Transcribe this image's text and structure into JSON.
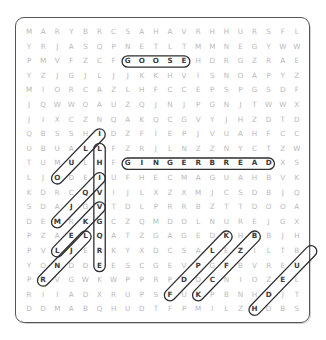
{
  "puzzle": {
    "type": "word-search",
    "rows": 20,
    "cols": 20,
    "frame_color": "#55555a",
    "letter_color": "#b9b9bd",
    "found_letter_color": "#3a3a40",
    "mark_color": "#2e2e33",
    "grid": [
      "MARYBRCSAHAVRHHURSFL",
      "YRJASQPNETLTMMNEGYWW",
      "PMVFZCFGOOSEHDRGZRAE",
      "YZJGJLJJKKHVISNOAPYZ",
      "MIORCAZLHFCCEPSPGSDF",
      "JQWWOAUZQJNJPGNJTWWX",
      "JIXCZNQAKQCGVYJHZDTD",
      "QBSSHIDZFIEPJVUAHFCC",
      "UBUALLFZRJLNZZNYCTZW",
      "TUMULHFGINGERBREADXS",
      "LJODEIUFHECMAGUAHBVK",
      "KDRCQVIJLXZXMJCSDBJQ",
      "SDAJGVTDLPRRBZTTDOOA",
      "DEMRKGCZQMDOLNUREJGX",
      "PZAELQATZGAGEDKHBBJH",
      "PVLJERKYXDCSALEZILTB",
      "YONDDEESCGEVPGFBVREU",
      "PRVGWKWPPRPDDCNIOZEL",
      "RIIADXRUPSFUKPBNHDJT",
      "DDMABQHUDTFPMILZHOBS"
    ],
    "found_words": [
      {
        "word": "GOOSE",
        "orientation": "horizontal",
        "row": 2,
        "col": 7
      },
      {
        "word": "GINGERBREAD",
        "orientation": "horizontal",
        "row": 9,
        "col": 7
      },
      {
        "word": "FRUITCAKE",
        "orientation": "vertical",
        "row": 8,
        "col": 5
      },
      {
        "word": "HALM",
        "orientation": "diagonal-down-left",
        "row": 7,
        "col": 5
      },
      {
        "word": "EDAZ",
        "orientation": "diagonal-down-left",
        "row": 10,
        "col": 5
      },
      {
        "word": "GJAP",
        "orientation": "diagonal-down-left",
        "row": 12,
        "col": 5
      },
      {
        "word": "ELAY",
        "orientation": "diagonal-down-left",
        "row": 14,
        "col": 4
      },
      {
        "word": "STNEF",
        "orientation": "diagonal-up-right",
        "row": 18,
        "col": 10
      },
      {
        "word": "EGSRP",
        "orientation": "diagonal-up-right",
        "row": 18,
        "col": 12
      },
      {
        "word": "HBREN",
        "orientation": "diagonal-up-right",
        "row": 19,
        "col": 16
      }
    ]
  }
}
